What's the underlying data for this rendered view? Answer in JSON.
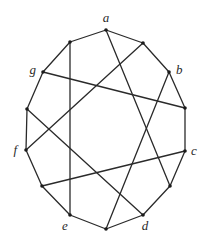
{
  "diagram": {
    "type": "graph",
    "vertices": [
      {
        "id": "a",
        "label": "a",
        "x": 106,
        "y": 30,
        "lx": 106,
        "ly": 22,
        "anchor": "middle"
      },
      {
        "id": "v1",
        "label": "",
        "x": 143,
        "y": 43,
        "lx": 0,
        "ly": 0,
        "anchor": "middle"
      },
      {
        "id": "b",
        "label": "b",
        "x": 169,
        "y": 72,
        "lx": 176,
        "ly": 74,
        "anchor": "start"
      },
      {
        "id": "v2",
        "label": "",
        "x": 185,
        "y": 108,
        "lx": 0,
        "ly": 0,
        "anchor": "middle"
      },
      {
        "id": "c",
        "label": "c",
        "x": 185,
        "y": 151,
        "lx": 191,
        "ly": 155,
        "anchor": "start"
      },
      {
        "id": "v3",
        "label": "",
        "x": 170,
        "y": 186,
        "lx": 0,
        "ly": 0,
        "anchor": "middle"
      },
      {
        "id": "d",
        "label": "d",
        "x": 143,
        "y": 215,
        "lx": 145,
        "ly": 230,
        "anchor": "middle"
      },
      {
        "id": "v4",
        "label": "",
        "x": 106,
        "y": 229,
        "lx": 0,
        "ly": 0,
        "anchor": "middle"
      },
      {
        "id": "e",
        "label": "e",
        "x": 70,
        "y": 215,
        "lx": 65,
        "ly": 230,
        "anchor": "middle"
      },
      {
        "id": "v5",
        "label": "",
        "x": 42,
        "y": 186,
        "lx": 0,
        "ly": 0,
        "anchor": "middle"
      },
      {
        "id": "f",
        "label": "f",
        "x": 26,
        "y": 150,
        "lx": 17,
        "ly": 154,
        "anchor": "end"
      },
      {
        "id": "v6",
        "label": "",
        "x": 27,
        "y": 109,
        "lx": 0,
        "ly": 0,
        "anchor": "middle"
      },
      {
        "id": "g",
        "label": "g",
        "x": 43,
        "y": 72,
        "lx": 36,
        "ly": 74,
        "anchor": "end"
      },
      {
        "id": "v7",
        "label": "",
        "x": 70,
        "y": 42,
        "lx": 0,
        "ly": 0,
        "anchor": "middle"
      }
    ],
    "edges": [
      [
        "a",
        "v1"
      ],
      [
        "v1",
        "b"
      ],
      [
        "b",
        "v2"
      ],
      [
        "v2",
        "c"
      ],
      [
        "c",
        "v3"
      ],
      [
        "v3",
        "d"
      ],
      [
        "d",
        "v4"
      ],
      [
        "v4",
        "e"
      ],
      [
        "e",
        "v5"
      ],
      [
        "v5",
        "f"
      ],
      [
        "f",
        "v6"
      ],
      [
        "v6",
        "g"
      ],
      [
        "g",
        "v7"
      ],
      [
        "v7",
        "a"
      ],
      [
        "v7",
        "e"
      ],
      [
        "v1",
        "f"
      ],
      [
        "g",
        "v2"
      ],
      [
        "a",
        "v3"
      ],
      [
        "b",
        "v4"
      ],
      [
        "v6",
        "d"
      ],
      [
        "v5",
        "c"
      ]
    ],
    "colors": {
      "edge": "#2a2a2a",
      "vertex": "#1a1a1a",
      "label": "#2a2a2a",
      "background": "#ffffff"
    }
  }
}
